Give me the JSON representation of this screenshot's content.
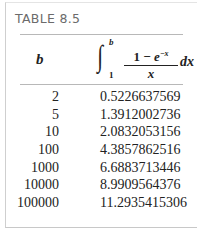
{
  "table": {
    "title": "TABLE 8.5",
    "header": {
      "col_b": "b",
      "integral_upper": "b",
      "integral_lower": "1",
      "numerator_one": "1",
      "numerator_minus": " − ",
      "numerator_e": "e",
      "numerator_exp": "−x",
      "denominator": "x",
      "differential": "dx"
    },
    "rows": [
      {
        "b": "2",
        "value": "0.5226637569"
      },
      {
        "b": "5",
        "value": "1.3912002736"
      },
      {
        "b": "10",
        "value": "2.0832053156"
      },
      {
        "b": "100",
        "value": "4.3857862516"
      },
      {
        "b": "1000",
        "value": "6.6883713446"
      },
      {
        "b": "10000",
        "value": "8.9909564376"
      },
      {
        "b": "100000",
        "value": "11.2935415306"
      }
    ]
  }
}
